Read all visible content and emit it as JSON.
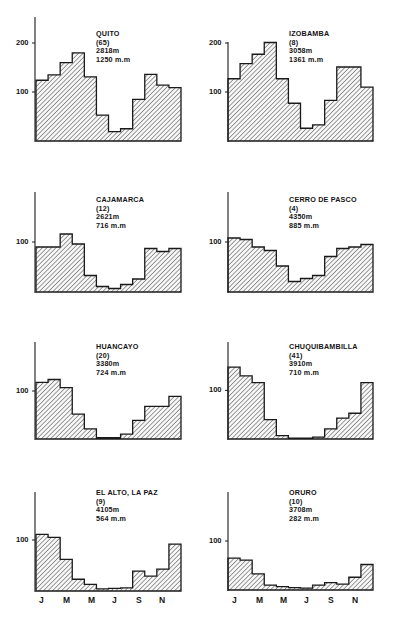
{
  "figure": {
    "months_axis": [
      "J",
      "M",
      "M",
      "J",
      "S",
      "N"
    ]
  },
  "chart_data": [
    {
      "type": "bar",
      "title": "QUITO",
      "station_id": "(65)",
      "altitude": "2818m",
      "annual_total": "1250 m.m",
      "categories": [
        "J",
        "F",
        "M",
        "A",
        "M",
        "J",
        "J",
        "A",
        "S",
        "O",
        "N",
        "D"
      ],
      "values": [
        124,
        135,
        160,
        180,
        131,
        53,
        19,
        25,
        85,
        136,
        114,
        109
      ],
      "yticks": [
        100,
        200
      ],
      "ylim": [
        0,
        250
      ],
      "xlabel": "",
      "ylabel": ""
    },
    {
      "type": "bar",
      "title": "IZOBAMBA",
      "station_id": "(8)",
      "altitude": "3058m",
      "annual_total": "1361 m.m",
      "categories": [
        "J",
        "F",
        "M",
        "A",
        "M",
        "J",
        "J",
        "A",
        "S",
        "O",
        "N",
        "D"
      ],
      "values": [
        127,
        158,
        177,
        201,
        127,
        77,
        26,
        33,
        83,
        151,
        151,
        110
      ],
      "yticks": [
        100,
        200
      ],
      "ylim": [
        0,
        210
      ],
      "xlabel": "",
      "ylabel": ""
    },
    {
      "type": "bar",
      "title": "CAJAMARCA",
      "station_id": "(12)",
      "altitude": "2621m",
      "annual_total": "716 m.m",
      "categories": [
        "J",
        "F",
        "M",
        "A",
        "M",
        "J",
        "J",
        "A",
        "S",
        "O",
        "N",
        "D"
      ],
      "values": [
        90,
        90,
        116,
        96,
        33,
        11,
        7,
        15,
        26,
        87,
        81,
        87
      ],
      "yticks": [
        100
      ],
      "ylim": [
        0,
        200
      ],
      "xlabel": "",
      "ylabel": ""
    },
    {
      "type": "bar",
      "title": "CERRO DE PASCO",
      "station_id": "(4)",
      "altitude": "4350m",
      "annual_total": "885 m.m",
      "categories": [
        "J",
        "F",
        "M",
        "A",
        "M",
        "J",
        "J",
        "A",
        "S",
        "O",
        "N",
        "D"
      ],
      "values": [
        108,
        105,
        90,
        83,
        52,
        21,
        27,
        33,
        71,
        87,
        90,
        95
      ],
      "yticks": [
        100
      ],
      "ylim": [
        0,
        200
      ],
      "xlabel": "",
      "ylabel": ""
    },
    {
      "type": "bar",
      "title": "HUANCAYO",
      "station_id": "(20)",
      "altitude": "3380m",
      "annual_total": "724 m.m",
      "categories": [
        "J",
        "F",
        "M",
        "A",
        "M",
        "J",
        "J",
        "A",
        "S",
        "O",
        "N",
        "D"
      ],
      "values": [
        118,
        124,
        107,
        52,
        21,
        3,
        3,
        10,
        39,
        68,
        68,
        89
      ],
      "yticks": [
        100
      ],
      "ylim": [
        0,
        200
      ],
      "xlabel": "",
      "ylabel": ""
    },
    {
      "type": "bar",
      "title": "CHUQUIBAMBILLA",
      "station_id": "(41)",
      "altitude": "3910m",
      "annual_total": "710 m.m",
      "categories": [
        "J",
        "F",
        "M",
        "A",
        "M",
        "J",
        "J",
        "A",
        "S",
        "O",
        "N",
        "D"
      ],
      "values": [
        148,
        130,
        116,
        40,
        7,
        2,
        2,
        4,
        21,
        43,
        53,
        116
      ],
      "yticks": [
        100
      ],
      "ylim": [
        0,
        200
      ],
      "xlabel": "",
      "ylabel": ""
    },
    {
      "type": "bar",
      "title": "EL ALTO, LA PAZ",
      "station_id": "(9)",
      "altitude": "4105m",
      "annual_total": "564 m.m",
      "categories": [
        "J",
        "F",
        "M",
        "A",
        "M",
        "J",
        "J",
        "A",
        "S",
        "O",
        "N",
        "D"
      ],
      "values": [
        111,
        105,
        62,
        23,
        13,
        4,
        5,
        6,
        39,
        29,
        43,
        92
      ],
      "yticks": [
        100
      ],
      "ylim": [
        0,
        200
      ],
      "xlabel": "",
      "ylabel": ""
    },
    {
      "type": "bar",
      "title": "ORURO",
      "station_id": "(10)",
      "altitude": "3708m",
      "annual_total": "282 m.m",
      "categories": [
        "J",
        "F",
        "M",
        "A",
        "M",
        "J",
        "J",
        "A",
        "S",
        "O",
        "N",
        "D"
      ],
      "values": [
        65,
        61,
        33,
        10,
        7,
        5,
        4,
        10,
        15,
        12,
        26,
        52
      ],
      "yticks": [
        100
      ],
      "ylim": [
        0,
        200
      ],
      "xlabel": "",
      "ylabel": ""
    }
  ]
}
